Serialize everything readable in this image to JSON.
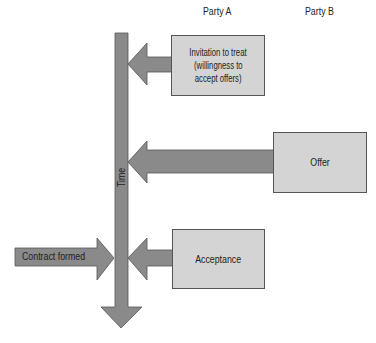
{
  "diagram": {
    "columns": {
      "party_a": "Party A",
      "party_b": "Party B"
    },
    "timeline": {
      "label": "Time"
    },
    "boxes": {
      "invitation": {
        "lines": [
          "Invitation to treat",
          "(willingness to",
          "accept offers)"
        ],
        "party": "Party A"
      },
      "offer": {
        "lines": [
          "Offer"
        ],
        "party": "Party B"
      },
      "acceptance": {
        "lines": [
          "Acceptance"
        ],
        "party": "Party A"
      }
    },
    "outcome": {
      "label": "Contract formed"
    },
    "colors": {
      "arrow_fill": "#8a8a8a",
      "arrow_stroke": "#555555",
      "box_fill": "#d4d4d4",
      "box_stroke": "#555555"
    }
  }
}
